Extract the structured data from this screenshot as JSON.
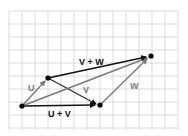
{
  "diagram": {
    "type": "vector-addition",
    "grid": {
      "x0": 9,
      "y0": 11,
      "cell": 13,
      "cols": 13,
      "rows": 9,
      "color": "#cfcfcf"
    },
    "points": {
      "origin": {
        "x": 22,
        "y": 106
      },
      "u_tip": {
        "x": 48,
        "y": 78
      },
      "uv_tip": {
        "x": 100,
        "y": 105
      },
      "uvw_tip": {
        "x": 151,
        "y": 56
      }
    },
    "labels": {
      "u": "U",
      "v": "V",
      "w": "W",
      "u_plus_v": "U + V",
      "v_plus_w": "V + W"
    },
    "colors": {
      "dark": "#111111",
      "gray": "#7a7a7a"
    }
  }
}
